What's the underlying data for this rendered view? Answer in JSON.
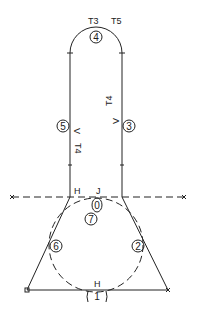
{
  "diagram": {
    "type": "flat-pattern-layout",
    "labels": {
      "t3": "T3",
      "t5": "T5",
      "t4_right": "T4",
      "t4_left": "T4",
      "h_top": "H",
      "j": "J",
      "h_bottom": "H",
      "v_left": "V",
      "v_right": "V"
    },
    "numbered_points": {
      "p0": "0",
      "p1": "1",
      "p2": "2",
      "p3": "3",
      "p4": "4",
      "p5": "5",
      "p6": "6",
      "p7": "7"
    },
    "colors": {
      "line": "#222222",
      "background": "#ffffff"
    }
  }
}
